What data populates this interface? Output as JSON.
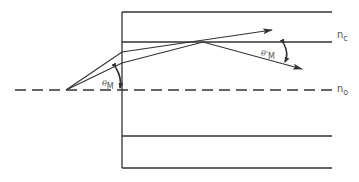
{
  "diagram": {
    "colors": {
      "line": "#333333",
      "background": "#ffffff",
      "label": "#555555"
    },
    "labels": {
      "core_index": {
        "symbol": "n",
        "subscript": "c"
      },
      "axis_index": {
        "symbol": "n",
        "subscript": "o"
      },
      "entry_angle": {
        "symbol": "θ",
        "subscript": "M"
      },
      "exit_angle": {
        "symbol": "θ'",
        "subscript": "M"
      }
    },
    "elements": {
      "entrance_face_x": 122,
      "top_line_y": 12,
      "core_boundary_y": 42,
      "axis_y": 90,
      "lower_boundary_y": 136,
      "bottom_line_y": 168,
      "right_end_x": 332,
      "axis_start_x": 15,
      "ray_origin": [
        66,
        90
      ]
    }
  }
}
